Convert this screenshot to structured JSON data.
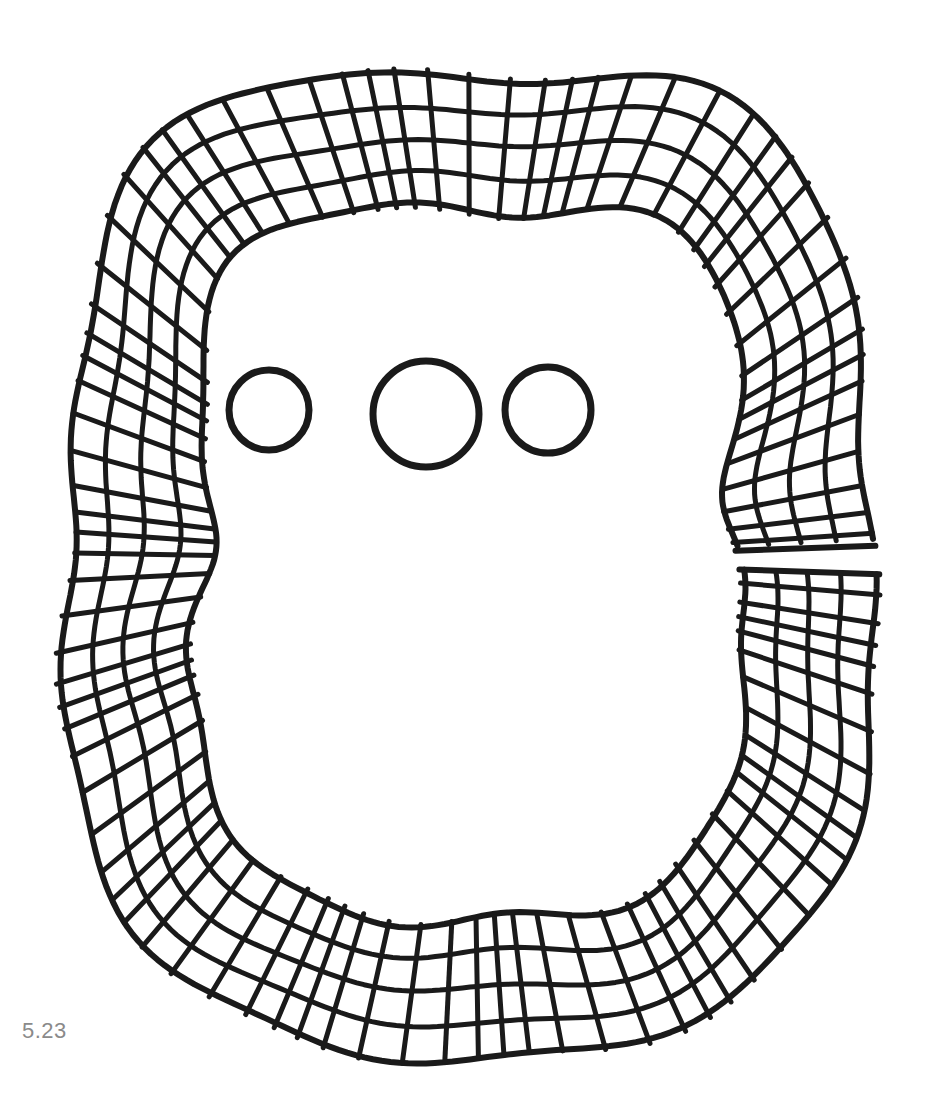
{
  "figure": {
    "caption": "5.23",
    "stroke_color": "#1a1a1a",
    "background": "#ffffff",
    "ring": {
      "center": [
        470,
        560
      ],
      "outer_radius": {
        "rx": 395,
        "ry": 490
      },
      "band_count": 4,
      "band_width": 34,
      "spoke_count": 92,
      "gap_angle_deg": [
        -2,
        2
      ]
    },
    "circles": [
      {
        "cx": 269,
        "cy": 410,
        "r": 40
      },
      {
        "cx": 426,
        "cy": 414,
        "r": 53
      },
      {
        "cx": 548,
        "cy": 410,
        "r": 43
      }
    ]
  }
}
